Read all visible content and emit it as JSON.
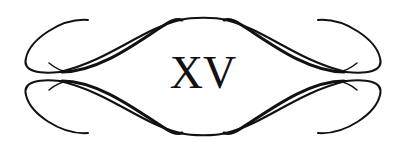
{
  "ornament": {
    "numeral": "XV",
    "stroke_color": "#111111",
    "background": "#ffffff"
  }
}
